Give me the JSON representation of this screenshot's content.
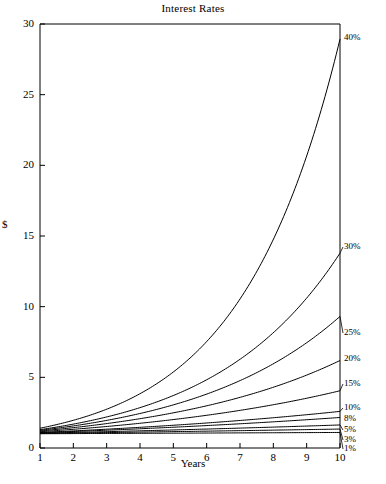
{
  "chart_data": {
    "type": "line",
    "title": "Interest Rates",
    "xlabel": "Years",
    "ylabel": "$",
    "xlim": [
      1,
      10
    ],
    "ylim": [
      0,
      30
    ],
    "xticks": [
      1,
      2,
      3,
      4,
      5,
      6,
      7,
      8,
      9,
      10
    ],
    "yticks": [
      0,
      5,
      10,
      15,
      20,
      25,
      30
    ],
    "grid": false,
    "legend_position": "right-inline-labels",
    "x": [
      1,
      2,
      3,
      4,
      5,
      6,
      7,
      8,
      9,
      10
    ],
    "series": [
      {
        "name": "40%",
        "label": "40%",
        "values": [
          1.4,
          1.96,
          2.74,
          3.84,
          5.38,
          7.53,
          10.54,
          14.76,
          20.66,
          28.93
        ]
      },
      {
        "name": "30%",
        "label": "30%",
        "values": [
          1.3,
          1.69,
          2.2,
          2.86,
          3.71,
          4.83,
          6.27,
          8.16,
          10.6,
          13.79
        ]
      },
      {
        "name": "25%",
        "label": "25%",
        "values": [
          1.25,
          1.56,
          1.95,
          2.44,
          3.05,
          3.81,
          4.77,
          5.96,
          7.45,
          9.31
        ]
      },
      {
        "name": "20%",
        "label": "20%",
        "values": [
          1.2,
          1.44,
          1.73,
          2.07,
          2.49,
          2.99,
          3.58,
          4.3,
          5.16,
          6.19
        ]
      },
      {
        "name": "15%",
        "label": "15%",
        "values": [
          1.15,
          1.32,
          1.52,
          1.75,
          2.01,
          2.31,
          2.66,
          3.06,
          3.52,
          4.05
        ]
      },
      {
        "name": "10%",
        "label": "10%",
        "values": [
          1.1,
          1.21,
          1.33,
          1.46,
          1.61,
          1.77,
          1.95,
          2.14,
          2.36,
          2.59
        ]
      },
      {
        "name": "8%",
        "label": "8%",
        "values": [
          1.08,
          1.17,
          1.26,
          1.36,
          1.47,
          1.59,
          1.71,
          1.85,
          2.0,
          2.16
        ]
      },
      {
        "name": "5%",
        "label": "5%",
        "values": [
          1.05,
          1.1,
          1.16,
          1.22,
          1.28,
          1.34,
          1.41,
          1.48,
          1.55,
          1.63
        ]
      },
      {
        "name": "3%",
        "label": "3%",
        "values": [
          1.03,
          1.06,
          1.09,
          1.13,
          1.16,
          1.19,
          1.23,
          1.27,
          1.3,
          1.34
        ]
      },
      {
        "name": "1%",
        "label": "1%",
        "values": [
          1.01,
          1.02,
          1.03,
          1.04,
          1.05,
          1.06,
          1.07,
          1.08,
          1.09,
          1.1
        ]
      }
    ],
    "line_color": "#000000",
    "axis_color": "#000000",
    "background_color": "#ffffff"
  }
}
